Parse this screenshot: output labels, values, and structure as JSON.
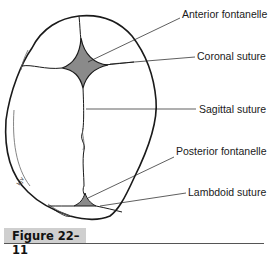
{
  "figure": {
    "caption": "Figure 22–11",
    "artist_initials": "kjv",
    "colors": {
      "fontanelle_fill": "#8a8a8a",
      "outline": "#1a1a1a",
      "caption_bg": "#cfcfcf"
    }
  },
  "labels": [
    {
      "id": "anterior-fontanelle",
      "text": "Anterior fontanelle"
    },
    {
      "id": "coronal-suture",
      "text": "Coronal suture"
    },
    {
      "id": "sagittal-suture",
      "text": "Sagittal suture"
    },
    {
      "id": "posterior-fontanelle",
      "text": "Posterior fontanelle"
    },
    {
      "id": "lambdoid-suture",
      "text": "Lambdoid suture"
    }
  ]
}
